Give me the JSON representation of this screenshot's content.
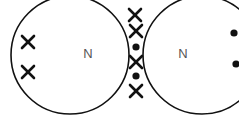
{
  "diagram": {
    "type": "dot-and-cross",
    "molecule_formula": "N2",
    "canvas": {
      "width": 239,
      "height": 119,
      "background": "#ffffff"
    },
    "stroke_color": "#111111",
    "label_color": "#555555",
    "atoms": [
      {
        "id": "atom-left",
        "element_symbol": "N",
        "label_x": 88,
        "label_y": 55,
        "circle": {
          "cx": 70,
          "cy": 55,
          "r": 59
        }
      },
      {
        "id": "atom-right",
        "element_symbol": "N",
        "label_x": 183,
        "label_y": 55,
        "circle": {
          "cx": 202,
          "cy": 55,
          "r": 59
        }
      }
    ],
    "electrons": [
      {
        "id": "lone-left-upper",
        "mark": "cross",
        "x": 28,
        "y": 42,
        "region": "left-atom-shell"
      },
      {
        "id": "lone-left-lower",
        "mark": "cross",
        "x": 28,
        "y": 72,
        "region": "left-atom-shell"
      },
      {
        "id": "bond-vertex-top",
        "mark": "cross",
        "x": 135,
        "y": 15,
        "region": "overlap-vertex"
      },
      {
        "id": "bond-cross-upper",
        "mark": "cross",
        "x": 136,
        "y": 31,
        "region": "overlap-lens"
      },
      {
        "id": "bond-dot-upper",
        "mark": "dot",
        "x": 136,
        "y": 47,
        "region": "overlap-lens"
      },
      {
        "id": "bond-cross-lower",
        "mark": "cross",
        "x": 136,
        "y": 62,
        "region": "overlap-lens"
      },
      {
        "id": "bond-dot-lower",
        "mark": "dot",
        "x": 136,
        "y": 76,
        "region": "overlap-lens"
      },
      {
        "id": "bond-vertex-bottom",
        "mark": "cross",
        "x": 136,
        "y": 91,
        "region": "overlap-vertex"
      },
      {
        "id": "lone-right-upper",
        "mark": "dot",
        "x": 234,
        "y": 33,
        "region": "right-atom-shell"
      },
      {
        "id": "lone-right-lower",
        "mark": "dot",
        "x": 236,
        "y": 64,
        "region": "right-atom-shell"
      }
    ],
    "cross_arm_length": 6,
    "dot_radius": 3.6
  }
}
